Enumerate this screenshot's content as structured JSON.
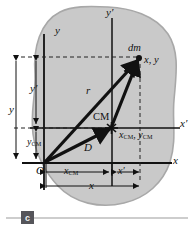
{
  "figure": {
    "type": "physics-diagram",
    "blob": {
      "fill": "#c9c9c9",
      "edge": "#a8a8a8"
    },
    "axes": {
      "y_label": "y",
      "x_label": "x",
      "y_prime_label": "y′",
      "x_prime_label": "x′",
      "origin_label": "O"
    },
    "points": {
      "mass_element_label": "dm",
      "mass_element_coords": "x, y",
      "cm_label": "CM",
      "cm_coords_x": "x",
      "cm_coords_x_sub": "CM",
      "cm_coords_y": "y",
      "cm_coords_y_sub": "CM",
      "cm_coords_separator": ", "
    },
    "vectors": {
      "r_label": "r",
      "d_label": "D"
    },
    "dimensions": {
      "y_total": "y",
      "y_prime": "y′",
      "y_cm_base": "y",
      "y_cm_sub": "CM",
      "x_cm_base": "x",
      "x_cm_sub": "CM",
      "x_prime": "x′",
      "x_total": "x"
    },
    "caption": {
      "part_label": "c",
      "rule_color": "#bdbdbd"
    },
    "colors": {
      "ink": "#111111",
      "dash": "#222222"
    }
  }
}
